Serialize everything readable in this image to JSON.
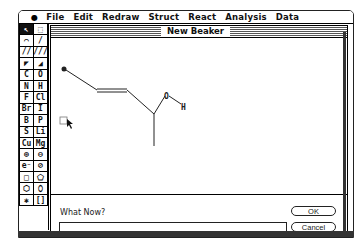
{
  "menubar": {
    "apple_icon": "apple-logo",
    "items": [
      "File",
      "Edit",
      "Redraw",
      "Struct",
      "React",
      "Analysis",
      "Data"
    ]
  },
  "palette": {
    "tools": [
      {
        "name": "arrow-tool",
        "glyph": "↖",
        "selected": true
      },
      {
        "name": "marquee-select-tool",
        "glyph": "⬚",
        "selected": false
      },
      {
        "name": "lasso-tool",
        "glyph": "⌒",
        "selected": false
      },
      {
        "name": "single-bond-tool",
        "glyph": "/",
        "selected": false
      },
      {
        "name": "double-bond-tool",
        "glyph": "//",
        "selected": false
      },
      {
        "name": "triple-bond-tool",
        "glyph": "///",
        "selected": false
      },
      {
        "name": "wedge-bond-tool",
        "glyph": "◤",
        "selected": false
      },
      {
        "name": "hash-wedge-bond-tool",
        "glyph": "◢",
        "selected": false
      },
      {
        "name": "atom-c",
        "glyph": "C",
        "selected": false
      },
      {
        "name": "atom-o",
        "glyph": "O",
        "selected": false
      },
      {
        "name": "atom-n",
        "glyph": "N",
        "selected": false
      },
      {
        "name": "atom-h",
        "glyph": "H",
        "selected": false
      },
      {
        "name": "atom-f",
        "glyph": "F",
        "selected": false
      },
      {
        "name": "atom-cl",
        "glyph": "Cl",
        "selected": false
      },
      {
        "name": "atom-br",
        "glyph": "Br",
        "selected": false
      },
      {
        "name": "atom-i",
        "glyph": "I",
        "selected": false
      },
      {
        "name": "atom-b",
        "glyph": "B",
        "selected": false
      },
      {
        "name": "atom-p",
        "glyph": "P",
        "selected": false
      },
      {
        "name": "atom-s",
        "glyph": "S",
        "selected": false
      },
      {
        "name": "atom-li",
        "glyph": "Li",
        "selected": false
      },
      {
        "name": "atom-cu",
        "glyph": "Cu",
        "selected": false
      },
      {
        "name": "atom-mg",
        "glyph": "Mg",
        "selected": false
      },
      {
        "name": "positive-charge-tool",
        "glyph": "⊕",
        "selected": false
      },
      {
        "name": "negative-charge-tool",
        "glyph": "⊖",
        "selected": false
      },
      {
        "name": "electron-tool",
        "glyph": "e⁻",
        "selected": false
      },
      {
        "name": "eraser-tool",
        "glyph": "⊘",
        "selected": false
      },
      {
        "name": "square-ring-tool",
        "glyph": "□",
        "selected": false
      },
      {
        "name": "pentagon-ring-tool",
        "glyph": "⬠",
        "selected": false
      },
      {
        "name": "hexagon-ring-tool",
        "glyph": "⬡",
        "selected": false
      },
      {
        "name": "heptagon-ring-tool",
        "glyph": "⬯",
        "selected": false
      },
      {
        "name": "radical-tool",
        "glyph": "✱",
        "selected": false
      },
      {
        "name": "bracket-tool",
        "glyph": "[]",
        "selected": false
      }
    ]
  },
  "window": {
    "title": "New Beaker"
  },
  "molecule": {
    "atoms": [
      {
        "label": "●",
        "x": 12,
        "y": 30
      },
      {
        "label": "O",
        "x": 114,
        "y": 55
      },
      {
        "label": "H",
        "x": 132,
        "y": 70
      }
    ]
  },
  "prompt": {
    "label": "What Now?",
    "input_value": "",
    "ok_label": "OK",
    "cancel_label": "Cancel"
  }
}
